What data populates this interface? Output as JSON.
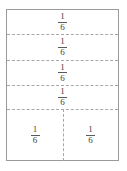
{
  "figure": {
    "box": {
      "border_color": "#9a9a9a",
      "fill_color": "#ffffff"
    },
    "divider": {
      "color": "#a8a8a8",
      "style": "dashed"
    },
    "text_color": "#3f3f3f",
    "rows": [
      {
        "row_index": 1,
        "cells": [
          {
            "numerator": "1",
            "denominator": "6"
          }
        ]
      },
      {
        "row_index": 2,
        "cells": [
          {
            "numerator": "1",
            "denominator": "6"
          }
        ]
      },
      {
        "row_index": 3,
        "cells": [
          {
            "numerator": "1",
            "denominator": "6"
          }
        ]
      },
      {
        "row_index": 4,
        "cells": [
          {
            "numerator": "1",
            "denominator": "6"
          }
        ]
      },
      {
        "row_index": 5,
        "cells": [
          {
            "numerator": "1",
            "denominator": "6"
          },
          {
            "numerator": "1",
            "denominator": "6"
          }
        ]
      }
    ]
  }
}
